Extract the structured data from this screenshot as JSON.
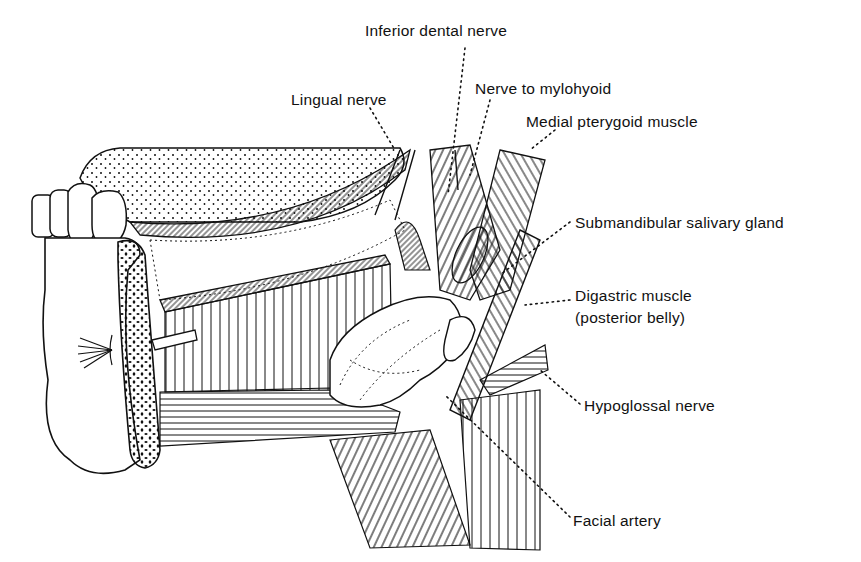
{
  "figure": {
    "type": "anatomical-line-drawing",
    "ink_color": "#111111",
    "background_color": "#ffffff"
  },
  "labels": [
    {
      "id": "inferior-dental-nerve",
      "text": "Inferior dental nerve",
      "x": 365,
      "y": 22
    },
    {
      "id": "lingual-nerve",
      "text": "Lingual nerve",
      "x": 291,
      "y": 91
    },
    {
      "id": "nerve-to-mylohyoid",
      "text": "Nerve to mylohyoid",
      "x": 475,
      "y": 80
    },
    {
      "id": "medial-pterygoid-muscle",
      "text": "Medial pterygoid muscle",
      "x": 526,
      "y": 113
    },
    {
      "id": "submandibular-salivary-gland",
      "text": "Submandibular salivary gland",
      "x": 575,
      "y": 214
    },
    {
      "id": "digastric-muscle-line1",
      "text": "Digastric muscle",
      "x": 575,
      "y": 287
    },
    {
      "id": "digastric-muscle-line2",
      "text": "(posterior belly)",
      "x": 575,
      "y": 309
    },
    {
      "id": "hypoglossal-nerve",
      "text": "Hypoglossal nerve",
      "x": 584,
      "y": 397
    },
    {
      "id": "facial-artery",
      "text": "Facial artery",
      "x": 573,
      "y": 512
    }
  ]
}
